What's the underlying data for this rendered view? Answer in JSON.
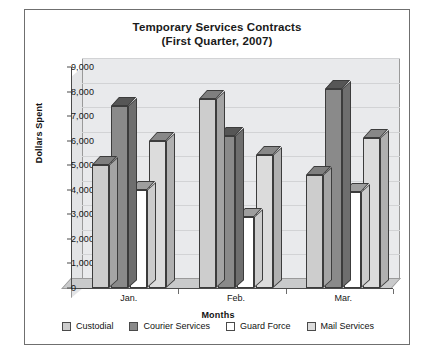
{
  "chart_data": {
    "type": "bar",
    "title": "Temporary Services Contracts",
    "subtitle": "(First Quarter, 2007)",
    "xlabel": "Months",
    "ylabel": "Dollars Spent",
    "categories": [
      "Jan.",
      "Feb.",
      "Mar."
    ],
    "ylim": [
      0,
      9000
    ],
    "ytick_labels": [
      "0",
      "1,000",
      "2,000",
      "3,000",
      "4,000",
      "5,000",
      "6,000",
      "7,000",
      "8,000",
      "9,000"
    ],
    "ytick_values": [
      0,
      1000,
      2000,
      3000,
      4000,
      5000,
      6000,
      7000,
      8000,
      9000
    ],
    "grid": true,
    "legend_position": "bottom",
    "three_d": true,
    "series": [
      {
        "name": "Custodial",
        "color": "#cdcdcd",
        "values": [
          5000,
          7700,
          4600
        ]
      },
      {
        "name": "Courier Services",
        "color": "#8a8a8a",
        "values": [
          7400,
          6200,
          8100
        ]
      },
      {
        "name": "Guard Force",
        "color": "#ffffff",
        "values": [
          4000,
          2900,
          3900
        ]
      },
      {
        "name": "Mail Services",
        "color": "#dcdcdc",
        "values": [
          6000,
          5400,
          6100
        ]
      }
    ]
  }
}
